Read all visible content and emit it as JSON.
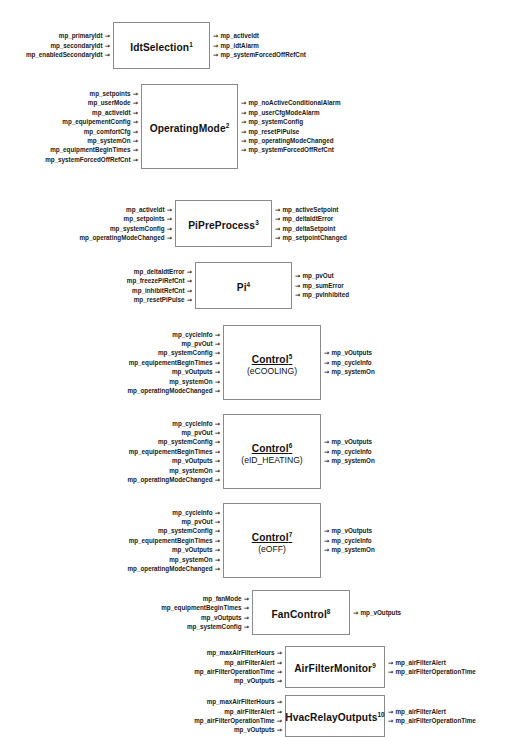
{
  "diagram": {
    "arrow_glyph": "→",
    "blocks": [
      {
        "name": "IdtSelection",
        "index": "1",
        "subtitle": "",
        "underlined": false,
        "inputs": [
          "mp_primaryIdt",
          "mp_secondaryIdt",
          "mp_enabledSecondaryIdt"
        ],
        "outputs": [
          "mp_activeIdt",
          "mp_idtAlarm",
          "mp_systemForcedOffRefCnt"
        ]
      },
      {
        "name": "OperatingMode",
        "index": "2",
        "subtitle": "",
        "underlined": false,
        "inputs": [
          "mp_setpoints",
          "mp_userMode",
          "mp_activeIdt",
          "mp_equipementConfig",
          "mp_comfortCfg",
          "mp_systemOn",
          "mp_equipmentBeginTimes",
          "mp_systemForcedOffRefCnt"
        ],
        "outputs": [
          "mp_noActiveConditionalAlarm",
          "mp_userCfgModeAlarm",
          "mp_systemConfig",
          "mp_resetPiPulse",
          "mp_operatingModeChanged",
          "mp_systemForcedOffRefCnt"
        ]
      },
      {
        "name": "PiPreProcess",
        "index": "3",
        "subtitle": "",
        "underlined": false,
        "inputs": [
          "mp_activeIdt",
          "mp_setpoints",
          "mp_systemConfig",
          "mp_operatingModeChanged"
        ],
        "outputs": [
          "mp_activeSetpoint",
          "mp_deltaIdtError",
          "mp_deltaSetpoint",
          "mp_setpointChanged"
        ]
      },
      {
        "name": "Pi",
        "index": "4",
        "subtitle": "",
        "underlined": false,
        "inputs": [
          "mp_deltaIdtError",
          "mp_freezePiRefCnt",
          "mp_inhibitRefCnt",
          "mp_resetPiPulse"
        ],
        "outputs": [
          "mp_pvOut",
          "mp_sumError",
          "mp_pvInhibited"
        ]
      },
      {
        "name": "Control",
        "index": "5",
        "subtitle": "(eCOOLING)",
        "underlined": true,
        "inputs": [
          "mp_cycleInfo",
          "mp_pvOut",
          "mp_systemConfig",
          "mp_equipementBeginTimes",
          "mp_vOutputs",
          "mp_systemOn",
          "mp_operatingModeChanged"
        ],
        "outputs": [
          "mp_vOutputs",
          "mp_cycleInfo",
          "mp_systemOn"
        ]
      },
      {
        "name": "Control",
        "index": "6",
        "subtitle": "(eID_HEATING)",
        "underlined": true,
        "inputs": [
          "mp_cycleInfo",
          "mp_pvOut",
          "mp_systemConfig",
          "mp_equipementBeginTimes",
          "mp_vOutputs",
          "mp_systemOn",
          "mp_operatingModeChanged"
        ],
        "outputs": [
          "mp_vOutputs",
          "mp_cycleInfo",
          "mp_systemOn"
        ]
      },
      {
        "name": "Control",
        "index": "7",
        "subtitle": "(eOFF)",
        "underlined": true,
        "inputs": [
          "mp_cycleInfo",
          "mp_pvOut",
          "mp_systemConfig",
          "mp_equipementBeginTimes",
          "mp_vOutputs",
          "mp_systemOn",
          "mp_operatingModeChanged"
        ],
        "outputs": [
          "mp_vOutputs",
          "mp_cycleInfo",
          "mp_systemOn"
        ]
      },
      {
        "name": "FanControl",
        "index": "8",
        "subtitle": "",
        "underlined": false,
        "inputs": [
          "mp_fanMode",
          "mp_equipmentBeginTimes",
          "mp_vOutputs",
          "mp_systemConfig"
        ],
        "outputs": [
          "mp_vOutputs"
        ]
      },
      {
        "name": "AirFilterMonitor",
        "index": "9",
        "subtitle": "",
        "underlined": false,
        "inputs": [
          "mp_maxAirFilterHours",
          "mp_airFilterAlert",
          "mp_airFilterOperationTime",
          "mp_vOutputs"
        ],
        "outputs": [
          "mp_airFilterAlert",
          "mp_airFilterOperationTime"
        ]
      },
      {
        "name": "HvacRelayOutputs",
        "index": "10",
        "subtitle": "",
        "underlined": false,
        "inputs": [
          "mp_maxAirFilterHours",
          "mp_airFilterAlert",
          "mp_airFilterOperationTime",
          "mp_vOutputs"
        ],
        "outputs": [
          "mp_airFilterAlert",
          "mp_airFilterOperationTime"
        ]
      }
    ],
    "layout": [
      {
        "box_left": 113,
        "box_top": 22,
        "box_w": 97,
        "box_h": 47
      },
      {
        "box_left": 141,
        "box_top": 84,
        "box_w": 97,
        "box_h": 85
      },
      {
        "box_left": 175,
        "box_top": 200,
        "box_w": 97,
        "box_h": 47
      },
      {
        "box_left": 195,
        "box_top": 262,
        "box_w": 97,
        "box_h": 47
      },
      {
        "box_left": 223,
        "box_top": 325,
        "box_w": 98,
        "box_h": 75
      },
      {
        "box_left": 223,
        "box_top": 414,
        "box_w": 98,
        "box_h": 75
      },
      {
        "box_left": 223,
        "box_top": 503,
        "box_w": 98,
        "box_h": 75
      },
      {
        "box_left": 252,
        "box_top": 590,
        "box_w": 98,
        "box_h": 45
      },
      {
        "box_left": 285,
        "box_top": 646,
        "box_w": 100,
        "box_h": 42
      },
      {
        "box_left": 285,
        "box_top": 695,
        "box_w": 100,
        "box_h": 42
      }
    ]
  }
}
